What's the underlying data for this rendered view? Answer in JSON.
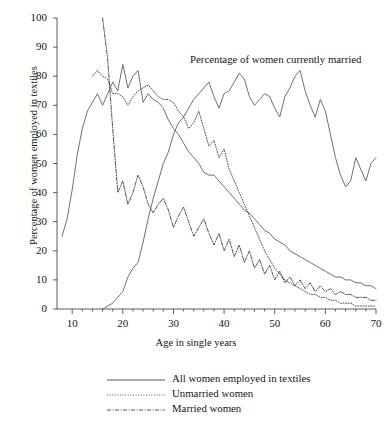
{
  "chart_data": {
    "type": "line",
    "title": "",
    "xlabel": "Age in single years",
    "ylabel": "Percentage of women employed in textiles",
    "xlim": [
      7,
      70
    ],
    "ylim": [
      0,
      100
    ],
    "grid": false,
    "legend_position": "below-plot",
    "xticks": [
      "10",
      "20",
      "30",
      "40",
      "50",
      "60",
      "70"
    ],
    "xtick_values": [
      10,
      20,
      30,
      40,
      50,
      60,
      70
    ],
    "yticks": [
      "0",
      "10",
      "20",
      "30",
      "40",
      "50",
      "60",
      "70",
      "80",
      "90",
      "100"
    ],
    "ytick_values": [
      0,
      10,
      20,
      30,
      40,
      50,
      60,
      70,
      80,
      90,
      100
    ],
    "annotations": [
      {
        "text": "Percentage of women currently married",
        "x": 40,
        "y": 88
      }
    ],
    "series": [
      {
        "name": "All women employed in textiles",
        "style": "solid",
        "color": "#555555",
        "x": [
          8,
          9,
          10,
          11,
          12,
          13,
          14,
          15,
          16,
          17,
          18,
          19,
          20,
          21,
          22,
          23,
          24,
          25,
          26,
          27,
          28,
          29,
          30,
          31,
          32,
          33,
          34,
          35,
          36,
          37,
          38,
          39,
          40,
          41,
          42,
          43,
          44,
          45,
          46,
          47,
          48,
          49,
          50,
          51,
          52,
          53,
          54,
          55,
          56,
          57,
          58,
          59,
          60,
          61,
          62,
          63,
          64,
          65,
          66,
          67,
          68,
          69,
          70
        ],
        "values": [
          25,
          31,
          41,
          53,
          62,
          68,
          71,
          74,
          70,
          74,
          78,
          75,
          84,
          76,
          80,
          82,
          71,
          74,
          72,
          71,
          69,
          65,
          62,
          60,
          57,
          54,
          52,
          50,
          47,
          46,
          46,
          44,
          42,
          40,
          38,
          36,
          34,
          33,
          31,
          29,
          27,
          26,
          24,
          23,
          22,
          20,
          19,
          18,
          17,
          16,
          15,
          14,
          13,
          12,
          11,
          11,
          10,
          10,
          9,
          9,
          8,
          8,
          7
        ]
      },
      {
        "name": "Unmarried women",
        "style": "dotted",
        "color": "#333333",
        "x": [
          14,
          15,
          16,
          17,
          18,
          19,
          20,
          21,
          22,
          23,
          24,
          25,
          26,
          27,
          28,
          29,
          30,
          31,
          32,
          33,
          34,
          35,
          36,
          37,
          38,
          39,
          40,
          41,
          42,
          43,
          44,
          45,
          46,
          47,
          48,
          49,
          50,
          51,
          52,
          53,
          54,
          55,
          56,
          57,
          58,
          59,
          60,
          61,
          62,
          63,
          64,
          65,
          66,
          67,
          68,
          69,
          70
        ],
        "values": [
          80,
          82,
          80,
          79,
          74,
          74,
          73,
          70,
          73,
          75,
          76,
          77,
          75,
          73,
          72,
          72,
          71,
          68,
          66,
          62,
          64,
          68,
          62,
          56,
          58,
          52,
          55,
          48,
          44,
          40,
          36,
          32,
          28,
          24,
          20,
          17,
          14,
          12,
          10,
          9,
          8,
          7,
          6,
          5,
          5,
          4,
          4,
          3,
          3,
          2,
          2,
          2,
          1,
          1,
          1,
          1,
          1
        ]
      },
      {
        "name": "Married women",
        "style": "dashdot",
        "color": "#333333",
        "x": [
          16,
          17,
          18,
          19,
          20,
          21,
          22,
          23,
          24,
          25,
          26,
          27,
          28,
          29,
          30,
          31,
          32,
          33,
          34,
          35,
          36,
          37,
          38,
          39,
          40,
          41,
          42,
          43,
          44,
          45,
          46,
          47,
          48,
          49,
          50,
          51,
          52,
          53,
          54,
          55,
          56,
          57,
          58,
          59,
          60,
          61,
          62,
          63,
          64,
          65,
          66,
          67,
          68,
          69,
          70
        ],
        "values": [
          100,
          86,
          62,
          40,
          44,
          36,
          40,
          46,
          42,
          36,
          33,
          36,
          38,
          34,
          28,
          32,
          35,
          30,
          25,
          28,
          31,
          26,
          22,
          26,
          20,
          24,
          18,
          22,
          16,
          20,
          14,
          17,
          12,
          15,
          10,
          13,
          9,
          11,
          8,
          10,
          7,
          9,
          6,
          8,
          6,
          7,
          5,
          6,
          5,
          5,
          4,
          4,
          4,
          3,
          3
        ]
      }
    ],
    "married_pct_series": {
      "name": "Percentage of women currently married",
      "style": "solid",
      "color": "#555555",
      "x": [
        16,
        17,
        18,
        19,
        20,
        21,
        22,
        23,
        24,
        25,
        26,
        27,
        28,
        29,
        30,
        31,
        32,
        33,
        34,
        35,
        36,
        37,
        38,
        39,
        40,
        41,
        42,
        43,
        44,
        45,
        46,
        47,
        48,
        49,
        50,
        51,
        52,
        53,
        54,
        55,
        56,
        57,
        58,
        59,
        60,
        61,
        62,
        63,
        64,
        65,
        66,
        67,
        68,
        69,
        70
      ],
      "values": [
        0,
        1,
        2,
        4,
        6,
        11,
        14,
        16,
        23,
        31,
        38,
        44,
        50,
        54,
        60,
        64,
        66,
        69,
        72,
        74,
        76,
        78,
        73,
        69,
        74,
        75,
        78,
        81,
        79,
        73,
        70,
        72,
        74,
        73,
        69,
        66,
        73,
        76,
        80,
        82,
        75,
        70,
        66,
        72,
        68,
        60,
        52,
        46,
        42,
        44,
        52,
        48,
        44,
        50,
        52
      ]
    }
  },
  "legend": {
    "items": [
      {
        "label": "All women employed in textiles",
        "style": "solid"
      },
      {
        "label": "Unmarried women",
        "style": "dotted"
      },
      {
        "label": "Married women",
        "style": "dashdot"
      }
    ]
  }
}
